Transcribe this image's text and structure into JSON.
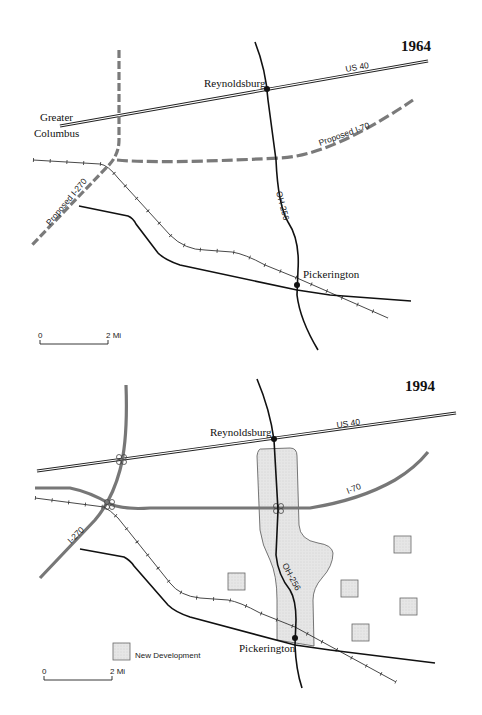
{
  "maps": [
    {
      "year": "1964",
      "labels": {
        "us40": "US 40",
        "reynoldsburg": "Reynoldsburg",
        "greater": "Greater",
        "columbus": "Columbus",
        "proposed_i70": "Proposed I-70",
        "proposed_i270": "Proposed I-270",
        "oh256": "OH-256",
        "pickerington": "Pickerington"
      },
      "scale": {
        "start": "0",
        "end": "2 Mi"
      }
    },
    {
      "year": "1994",
      "labels": {
        "us40": "US 40",
        "reynoldsburg": "Reynoldsburg",
        "i70": "I-70",
        "i270": "I-270",
        "oh256": "OH-256",
        "pickerington": "Pickerington"
      },
      "legend": {
        "new_development": "New Development"
      },
      "scale": {
        "start": "0",
        "end": "2 Mi"
      }
    }
  ],
  "colors": {
    "road": "#111111",
    "highway": "#777777",
    "development_fill": "#e3e3e3",
    "development_stroke": "#555555"
  }
}
